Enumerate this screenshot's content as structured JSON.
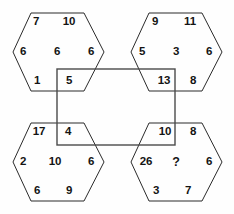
{
  "puzzle": {
    "type": "hexagon-number-puzzle",
    "missing_marker": "?",
    "hexagons": [
      {
        "id": "top-left",
        "corners": {
          "top_left": "7",
          "top_right": "10",
          "left": "6",
          "right": "6",
          "bottom_left": "1",
          "bottom_right": "5"
        },
        "center": "6"
      },
      {
        "id": "top-right",
        "corners": {
          "top_left": "9",
          "top_right": "11",
          "left": "5",
          "right": "6",
          "bottom_left": "13",
          "bottom_right": "8"
        },
        "center": "3"
      },
      {
        "id": "bottom-left",
        "corners": {
          "top_left": "17",
          "top_right": "4",
          "left": "2",
          "right": "6",
          "bottom_left": "6",
          "bottom_right": "9"
        },
        "center": "10"
      },
      {
        "id": "bottom-right",
        "corners": {
          "top_left": "10",
          "top_right": "8",
          "left": "26",
          "right": "6",
          "bottom_left": "3",
          "bottom_right": "7"
        },
        "center": "?"
      }
    ],
    "colors": {
      "hex_stroke": "#2b2b2b",
      "rect_stroke": "#4a4a4a",
      "text": "#141414",
      "background": "#fefefe"
    }
  }
}
